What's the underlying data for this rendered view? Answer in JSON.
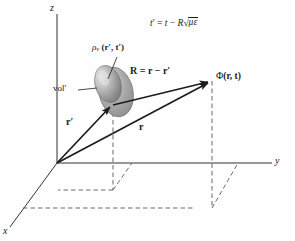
{
  "figure": {
    "background": "#fefefe",
    "line_color": "#1c1c1c",
    "dash_color": "#555555",
    "blob_fill": "#9a9a9a"
  },
  "axes": {
    "z_label": "z",
    "y_label": "y",
    "x_label": "x"
  },
  "equation": {
    "lhs": "t",
    "lhs_prime": "′",
    "eq": "=",
    "t": "t",
    "minus": "−",
    "R": "R",
    "radical": "√",
    "mu": "μ",
    "epsilon": "ε",
    "full": "t′ = t − R√(με)"
  },
  "labels": {
    "source_density": {
      "rho": "ρ",
      "subscript": "v",
      "args": "(r′, t′)",
      "full": "ρᵥ (r′, t′)"
    },
    "volume": "vol′",
    "R_vector": {
      "R": "R",
      "eq": "=",
      "r": "r",
      "minus": "−",
      "r_prime": "r′",
      "full": "R = r − r′"
    },
    "potential": {
      "phi": "Φ",
      "args": "(r, t)",
      "full": "Φ (r, t)"
    },
    "r_prime_vector": "r′",
    "r_vector": "r"
  },
  "vectors": [
    {
      "name": "r-prime",
      "from": [
        57,
        163
      ],
      "to": [
        113,
        105
      ],
      "label": "r′"
    },
    {
      "name": "r",
      "from": [
        57,
        163
      ],
      "to": [
        212,
        81
      ],
      "label": "r"
    },
    {
      "name": "R",
      "from": [
        113,
        105
      ],
      "to": [
        212,
        81
      ],
      "label": "R = r − r′"
    }
  ],
  "points": {
    "origin": [
      57,
      163
    ],
    "source": [
      113,
      105
    ],
    "field": [
      212,
      81
    ]
  }
}
